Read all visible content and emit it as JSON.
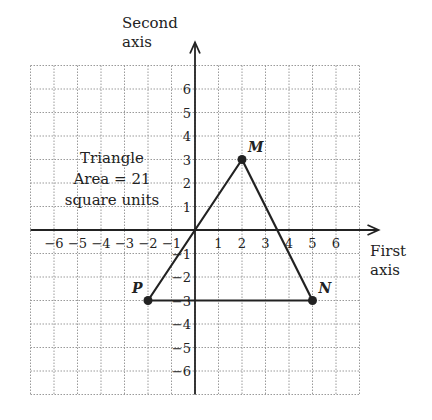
{
  "diagram": {
    "type": "coordinate-plane",
    "x_axis_label": [
      "First",
      "axis"
    ],
    "y_axis_label": [
      "Second",
      "axis"
    ],
    "x_range": [
      -7,
      7
    ],
    "y_range": [
      -7,
      7
    ],
    "x_ticks": [
      -6,
      -5,
      -4,
      -3,
      -2,
      -1,
      1,
      2,
      3,
      4,
      5,
      6
    ],
    "y_ticks": [
      6,
      5,
      4,
      3,
      2,
      1,
      -1,
      -2,
      -3,
      -4,
      -5,
      -6
    ],
    "annotation": [
      "Triangle",
      "Area = 21",
      "square units"
    ],
    "points": [
      {
        "name": "M",
        "x": 2,
        "y": 3
      },
      {
        "name": "N",
        "x": 5,
        "y": -3
      },
      {
        "name": "P",
        "x": -2,
        "y": -3
      }
    ],
    "polygon": [
      "P",
      "M",
      "N"
    ],
    "extra_segment_through_origin": true,
    "colors": {
      "ink": "#222222",
      "grid": "#9a9a9a",
      "background": "#ffffff"
    }
  }
}
